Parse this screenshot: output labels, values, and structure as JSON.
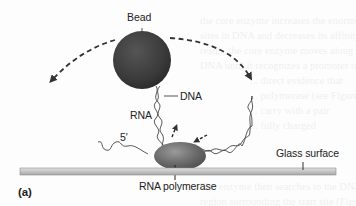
{
  "figure": {
    "panel_label": "(a)",
    "labels": {
      "bead": "Bead",
      "dna": "DNA",
      "rna": "RNA",
      "five_prime": "5′",
      "rna_polymerase": "RNA polymerase",
      "glass_surface": "Glass surface"
    },
    "colors": {
      "bead": "#3a3a3a",
      "polymerase": "#6e6e6e",
      "glass_surface": "#c9c9c9",
      "glass_edge": "#9a9a9a",
      "dashed_arc": "#333333",
      "text": "#222222"
    }
  },
  "bleed_through_text": [
    "the core enzyme increases the enormous affinity for promoter",
    "sites in DNA and decreases its affinity for DNA in general. As a",
    "result, the core enzyme moves along the DNA, sliding along the",
    "DNA until it recognizes a promoter region.",
    "... direct evidence that",
    "... polymerase (see Figure",
    "... carry with a pair",
    "... fully charged",
    "The enzyme then searches to the DNA strands in the",
    "region surrounding the start site (Figure 13.1b). The complex is"
  ]
}
